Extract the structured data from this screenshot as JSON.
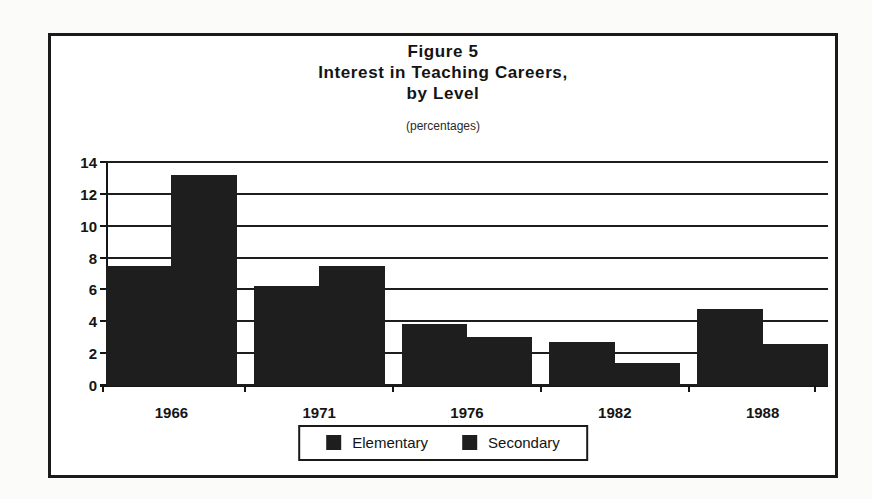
{
  "figure": {
    "title_lines": [
      "Figure 5",
      "Interest in Teaching Careers,",
      "by Level"
    ],
    "subtitle": "(percentages)"
  },
  "legend": {
    "entries": [
      {
        "label": "Elementary",
        "color": "#1e1e1e"
      },
      {
        "label": "Secondary",
        "color": "#1e1e1e"
      }
    ]
  },
  "axis": {
    "y_ticks": [
      "0",
      "2",
      "4",
      "6",
      "8",
      "10",
      "12",
      "14"
    ],
    "x_ticks": [
      "1966",
      "1971",
      "1976",
      "1982",
      "1988"
    ]
  },
  "colors": {
    "bar": "#1e1e1e",
    "frame": "#1a1a1a",
    "grid": "#1d1d1d",
    "text": "#141414",
    "paper": "#fbfbfa"
  },
  "chart_data": {
    "type": "bar",
    "subtitle": "(percentages)",
    "xlabel": "",
    "ylabel": "",
    "ylim": [
      0,
      14
    ],
    "ytick_step": 2,
    "grid": true,
    "legend_position": "bottom",
    "categories": [
      "1966",
      "1971",
      "1976",
      "1982",
      "1988"
    ],
    "series": [
      {
        "name": "Elementary",
        "values": [
          7.5,
          6.2,
          3.8,
          2.7,
          4.8
        ]
      },
      {
        "name": "Secondary",
        "values": [
          13.2,
          7.5,
          3.0,
          1.4,
          2.6
        ]
      }
    ]
  }
}
